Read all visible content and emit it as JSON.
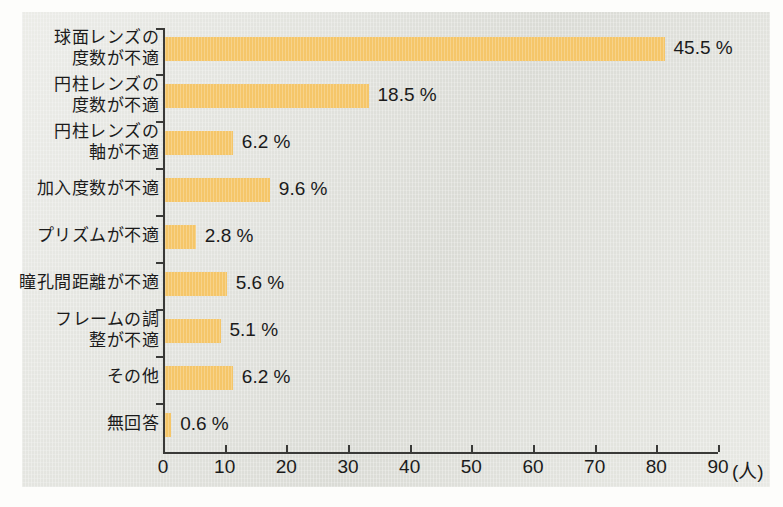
{
  "chart_data": {
    "type": "bar",
    "orientation": "horizontal",
    "title": "",
    "xlabel": "(人)",
    "ylabel": "",
    "xlim": [
      0,
      90
    ],
    "xticks": [
      0,
      10,
      20,
      30,
      40,
      50,
      60,
      70,
      80,
      90
    ],
    "xticklabels": [
      "0",
      "10",
      "20",
      "30",
      "40",
      "50",
      "60",
      "70",
      "80",
      "90"
    ],
    "unit_label": "(人)",
    "grid": false,
    "legend": null,
    "categories": [
      "球面レンズの\n度数が不適",
      "円柱レンズの\n度数が不適",
      "円柱レンズの\n軸が不適",
      "加入度数が不適",
      "プリズムが不適",
      "瞳孔間距離が不適",
      "フレームの調\n整が不適",
      "その他",
      "無回答"
    ],
    "values": [
      81,
      33,
      11,
      17,
      5,
      10,
      9,
      11,
      1
    ],
    "data_labels": [
      "45.5 %",
      "18.5 %",
      "6.2 %",
      "9.6 %",
      "2.8 %",
      "5.6 %",
      "5.1 %",
      "6.2 %",
      "0.6 %"
    ],
    "percentages": [
      45.5,
      18.5,
      6.2,
      9.6,
      2.8,
      5.6,
      5.1,
      6.2,
      0.6
    ],
    "bar_color": "#f5c669",
    "axis_color": "#3a3a38",
    "background_color": "#e3e4de",
    "text_color": "#1b1b1b"
  }
}
